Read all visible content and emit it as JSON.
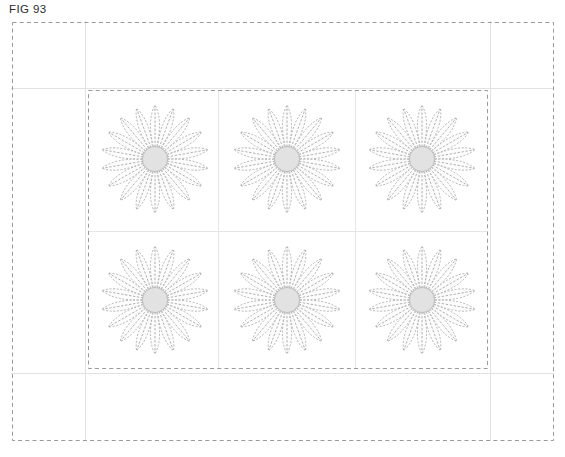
{
  "figure": {
    "label": "FIG 93",
    "caption_fragment": ""
  },
  "colors": {
    "background": "#ffffff",
    "outer_border_dash": "#9a9a9a",
    "inner_border_dash": "#9a9a9a",
    "guide_line": "#e2e2e2",
    "grid_line": "#e6e6e6",
    "petal_outline": "#a8a8a8",
    "petal_fill": "#fcfcfc",
    "petal_rib": "#9d9d9d",
    "center_fill": "#e2e2e2",
    "center_stroke": "#b9b9b9",
    "label_text": "#2b2b2b"
  },
  "layout": {
    "page_width": 565,
    "page_height": 457,
    "outer_frame": {
      "x": 12,
      "y": 22,
      "width": 541,
      "height": 418
    },
    "inner_frame": {
      "x": 88,
      "y": 90,
      "width": 399,
      "height": 278
    },
    "guides": {
      "vertical_x": [
        85,
        490
      ],
      "horizontal_y": [
        88,
        373
      ]
    },
    "grid": {
      "columns": 3,
      "rows": 2,
      "column_dividers_x": [
        218,
        355
      ],
      "row_dividers_y": [
        231
      ]
    }
  },
  "motif": {
    "name": "rosette-flower",
    "petal_count": 18,
    "outer_radius": 56,
    "center_radius": 13,
    "stroke_style": "dashed",
    "description": "radial daisy rosette with dashed teardrop petals and a solid gray hub"
  },
  "flowers": [
    {
      "id": "flower-r1c1",
      "row": 1,
      "column": 1,
      "cx": 155,
      "cy": 159,
      "radius": 54
    },
    {
      "id": "flower-r1c2",
      "row": 1,
      "column": 2,
      "cx": 287,
      "cy": 159,
      "radius": 54
    },
    {
      "id": "flower-r1c3",
      "row": 1,
      "column": 3,
      "cx": 422,
      "cy": 159,
      "radius": 54
    },
    {
      "id": "flower-r2c1",
      "row": 2,
      "column": 1,
      "cx": 155,
      "cy": 300,
      "radius": 54
    },
    {
      "id": "flower-r2c2",
      "row": 2,
      "column": 2,
      "cx": 287,
      "cy": 300,
      "radius": 54
    },
    {
      "id": "flower-r2c3",
      "row": 2,
      "column": 3,
      "cx": 422,
      "cy": 300,
      "radius": 54
    }
  ]
}
